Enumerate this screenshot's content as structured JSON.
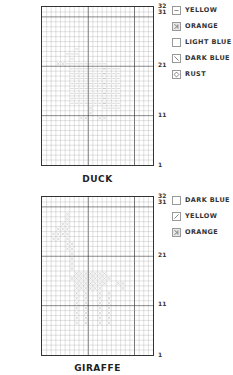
{
  "charts": [
    {
      "title": "DUCK",
      "row_labels": [
        "32",
        "31",
        "21",
        "11",
        "1"
      ],
      "legend": [
        {
          "label": "YELLOW",
          "icon": "dash-icon"
        },
        {
          "label": "ORANGE",
          "icon": "half-cross-icon"
        },
        {
          "label": "LIGHT BLUE",
          "icon": "blank-icon"
        },
        {
          "label": "DARK BLUE",
          "icon": "backslash-icon"
        },
        {
          "label": "RUST",
          "icon": "diamond-icon"
        }
      ]
    },
    {
      "title": "GIRAFFE",
      "row_labels": [
        "32",
        "31",
        "21",
        "11",
        "1"
      ],
      "legend": [
        {
          "label": "DARK BLUE",
          "icon": "blank-icon"
        },
        {
          "label": "YELLOW",
          "icon": "slash-icon"
        },
        {
          "label": "ORANGE",
          "icon": "half-cross-icon"
        }
      ]
    }
  ],
  "grid": {
    "columns": 24,
    "rows": 32,
    "major_every": 10,
    "line_color": "#999999",
    "major_color": "#333333",
    "stitch_color": "#b0b0b0"
  }
}
